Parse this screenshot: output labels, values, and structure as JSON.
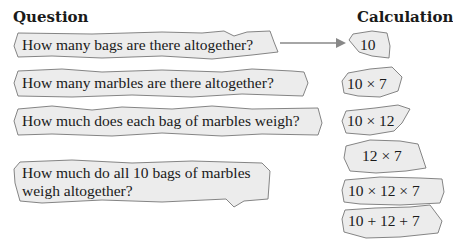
{
  "headings": {
    "question": "Question",
    "calculation": "Calculation"
  },
  "questions": [
    {
      "label": "How many bags are there altogether?"
    },
    {
      "label": "How many marbles are there altogether?"
    },
    {
      "label": "How much does each bag of marbles weigh?"
    },
    {
      "line1": "How much do all 10 bags of marbles",
      "line2": "weigh altogether?"
    }
  ],
  "calculations": [
    {
      "label": "10"
    },
    {
      "label": "10 × 7"
    },
    {
      "label": "10 × 12"
    },
    {
      "label": "12 × 7"
    },
    {
      "label": "10 × 12 × 7"
    },
    {
      "label": "10 + 12 + 7"
    }
  ],
  "arrow": {
    "from": "question-0",
    "to": "calculation-0",
    "color": "#888888"
  },
  "colors": {
    "blob_fill": "#ececec",
    "blob_stroke": "#777777",
    "text": "#1a1a1a"
  }
}
